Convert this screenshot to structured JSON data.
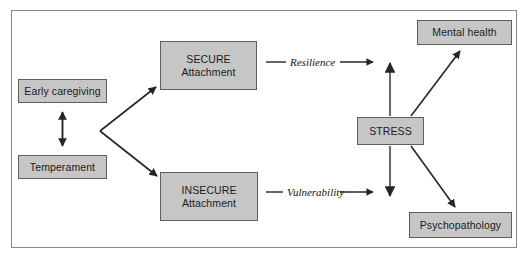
{
  "diagram": {
    "frame": {
      "border_color": "#8a8a8a",
      "background": "#ffffff"
    },
    "style": {
      "node_fill": "#c6c6c6",
      "node_border": "#5e5e5e",
      "arrow_color": "#262626",
      "text_color": "#1a1a1a"
    },
    "nodes": [
      {
        "id": "early-caregiving",
        "label": "Early caregiving",
        "line1": "Early caregiving",
        "line2": ""
      },
      {
        "id": "temperament",
        "label": "Temperament",
        "line1": "Temperament",
        "line2": ""
      },
      {
        "id": "secure",
        "label": "SECURE Attachment",
        "line1": "SECURE",
        "line2": "Attachment"
      },
      {
        "id": "insecure",
        "label": "INSECURE Attachment",
        "line1": "INSECURE",
        "line2": "Attachment"
      },
      {
        "id": "stress",
        "label": "STRESS",
        "line1": "STRESS",
        "line2": ""
      },
      {
        "id": "mental-health",
        "label": "Mental health",
        "line1": "Mental health",
        "line2": ""
      },
      {
        "id": "psychopathology",
        "label": "Psychopathology",
        "line1": "Psychopathology",
        "line2": ""
      }
    ],
    "edge_labels": {
      "resilience": "Resilience",
      "vulnerability": "Vulnerability"
    },
    "edges": [
      {
        "from": "early-caregiving",
        "to": "temperament",
        "type": "bidirectional",
        "label": ""
      },
      {
        "from": "early-caregiving",
        "to": "secure",
        "type": "directed",
        "label": ""
      },
      {
        "from": "temperament",
        "to": "insecure",
        "type": "directed",
        "label": ""
      },
      {
        "from": "secure",
        "to": "stress-up",
        "type": "directed",
        "label": "Resilience"
      },
      {
        "from": "insecure",
        "to": "stress-down",
        "type": "directed",
        "label": "Vulnerability"
      },
      {
        "from": "stress",
        "to": "mental-health",
        "type": "directed",
        "label": ""
      },
      {
        "from": "stress",
        "to": "psychopathology",
        "type": "directed",
        "label": ""
      }
    ]
  }
}
